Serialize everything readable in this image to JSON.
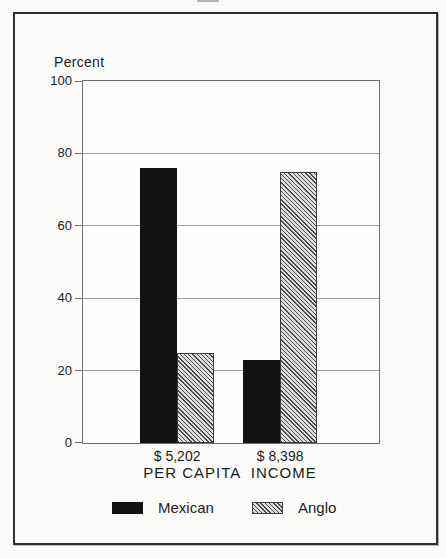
{
  "figure": {
    "y_unit_label": "Percent",
    "x_axis_title": "PER CAPITA  INCOME"
  },
  "chart_data": {
    "type": "bar",
    "title": "",
    "ylabel": "Percent",
    "xlabel": "PER CAPITA  INCOME",
    "categories": [
      "$ 5,202",
      "$ 8,398"
    ],
    "series": [
      {
        "name": "Mexican",
        "values": [
          76,
          23
        ],
        "fill": "solid",
        "color": "#121212"
      },
      {
        "name": "Anglo",
        "values": [
          25,
          75
        ],
        "fill": "diagonal-hatch",
        "color": "#dedede",
        "hatch_color": "#4a4a4a"
      }
    ],
    "ylim": [
      0,
      100
    ],
    "yticks": [
      0,
      20,
      40,
      60,
      80,
      100
    ],
    "grid": "horizontal-at-20-40-60-80",
    "legend_position": "bottom",
    "layout": {
      "group_centers_frac": [
        0.318,
        0.666
      ],
      "bar_width_px": 37,
      "plot_width_px": 296,
      "plot_height_px": 362
    }
  }
}
